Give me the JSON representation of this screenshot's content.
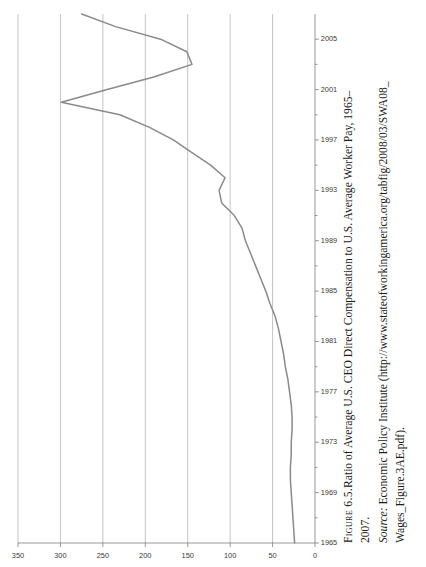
{
  "figure": {
    "label": "Figure 6.5.",
    "caption_line1": "Ratio of Average U.S. CEO Direct Compensation to U.S. Average Worker Pay, 1965–",
    "caption_line2": "2007.",
    "source_label": "Source:",
    "source_line1": " Economic Policy Institute (http://www.stateofworkingamerica.org/tabfig/2008/03/SWA08_",
    "source_line2": "Wages_Figure.3AE.pdf)."
  },
  "chart_data": {
    "type": "line",
    "xlabel": "",
    "ylabel": "",
    "xlim": [
      1965,
      2007
    ],
    "ylim": [
      0,
      350
    ],
    "grid": true,
    "legend": "none",
    "x_tick_labels": [
      "1965",
      "1969",
      "1973",
      "1977",
      "1981",
      "1985",
      "1989",
      "1993",
      "1997",
      "2001",
      "2005"
    ],
    "x_tick_values": [
      1965,
      1969,
      1973,
      1977,
      1981,
      1985,
      1989,
      1993,
      1997,
      2001,
      2005
    ],
    "x_minor_step": 2,
    "y_tick_labels": [
      "0",
      "50",
      "100",
      "150",
      "200",
      "250",
      "300",
      "350"
    ],
    "y_tick_values": [
      0,
      50,
      100,
      150,
      200,
      250,
      300,
      350
    ],
    "series": [
      {
        "name": "CEO-to-worker pay ratio",
        "color": "#8a8a8a",
        "x": [
          1965,
          1966,
          1967,
          1968,
          1969,
          1970,
          1971,
          1972,
          1973,
          1974,
          1975,
          1976,
          1977,
          1978,
          1979,
          1980,
          1981,
          1982,
          1983,
          1984,
          1985,
          1986,
          1987,
          1988,
          1989,
          1990,
          1991,
          1992,
          1993,
          1994,
          1995,
          1996,
          1997,
          1998,
          1999,
          2000,
          2001,
          2002,
          2003,
          2004,
          2005,
          2006,
          2007
        ],
        "values": [
          24,
          25,
          26,
          27,
          28,
          29,
          29,
          28,
          28,
          27,
          27,
          28,
          30,
          32,
          35,
          37,
          40,
          43,
          47,
          53,
          58,
          64,
          70,
          76,
          82,
          86,
          95,
          110,
          113,
          106,
          123,
          145,
          167,
          195,
          230,
          299,
          245,
          190,
          145,
          151,
          182,
          235,
          275
        ]
      }
    ]
  },
  "axis": {
    "y_axis_name": "ratio-axis",
    "x_axis_name": "year-axis"
  }
}
